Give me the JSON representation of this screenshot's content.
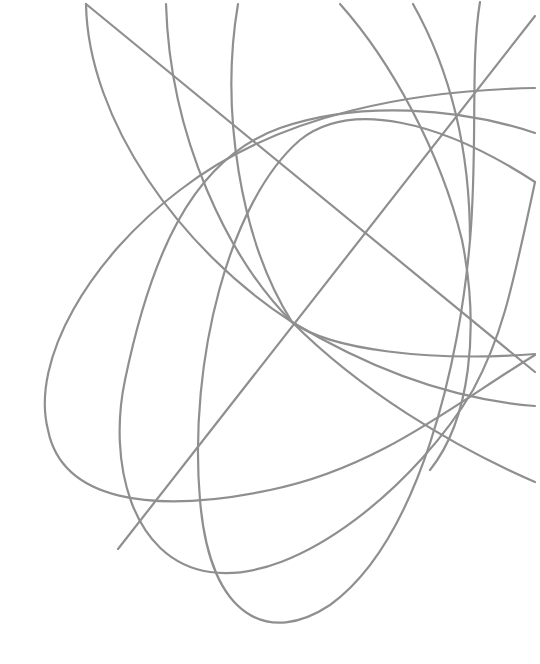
{
  "artwork": {
    "description": "Decorative abstract line art of intersecting gray elliptical curves and diagonal lines",
    "background": "#ffffff",
    "stroke_color": "#8f8f8f",
    "stroke_width": 2.2,
    "focal_point": {
      "x": 292,
      "y": 322
    },
    "paths": [
      {
        "id": "ellipse-wide",
        "d": "M 535 88 C 420 90, 280 112, 180 190 C 90 258, 30 360, 48 430 C 62 500, 150 515, 270 490 C 380 468, 460 400, 535 355"
      },
      {
        "id": "ellipse-mid",
        "d": "M 535 133 C 460 108, 360 100, 280 128 C 190 160, 150 260, 125 380 C 108 460, 130 560, 210 572 C 300 585, 420 480, 473 390 C 500 340, 510 300, 535 182"
      },
      {
        "id": "ellipse-tall",
        "d": "M 480 2 C 470 60, 478 150, 470 240 C 460 360, 420 540, 330 605 C 270 645, 210 620, 200 500 C 188 360, 230 200, 300 140 C 350 100, 440 120, 535 182"
      },
      {
        "id": "arc-left-a",
        "d": "M 86 4 C 88 120, 180 250, 292 322 C 380 375, 460 400, 535 406"
      },
      {
        "id": "arc-left-b",
        "d": "M 166 4 C 170 140, 230 260, 292 322 C 360 390, 450 445, 535 482"
      },
      {
        "id": "arc-left-c",
        "d": "M 238 4 C 220 110, 240 240, 292 322 C 330 350, 430 362, 535 354"
      },
      {
        "id": "arc-top-d",
        "d": "M 340 4 C 390 60, 440 150, 462 240 C 480 330, 470 420, 430 470"
      },
      {
        "id": "arc-top-e",
        "d": "M 413 4 C 450 70, 470 150, 470 240"
      },
      {
        "id": "line-diagonal-desc",
        "d": "M 86 4 L 535 372"
      },
      {
        "id": "line-diagonal-asc",
        "d": "M 118 549 L 535 16"
      }
    ]
  }
}
